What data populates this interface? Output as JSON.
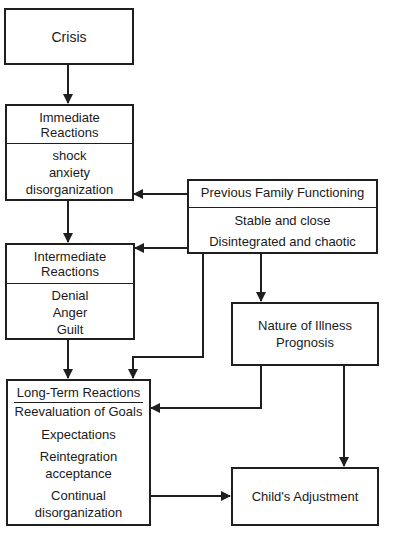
{
  "diagram": {
    "crisis": {
      "label": "Crisis"
    },
    "immediate": {
      "title": [
        "Immediate",
        "Reactions"
      ],
      "items": [
        "shock",
        "anxiety",
        "disorganization"
      ]
    },
    "intermediate": {
      "title": [
        "Intermediate",
        "Reactions"
      ],
      "items": [
        "Denial",
        "Anger",
        "Guilt"
      ]
    },
    "long_term": {
      "title": "Long-Term Reactions",
      "subtitle": "Reevaluation of Goals",
      "items": [
        "Expectations",
        "Reintegration",
        "acceptance",
        "Continual",
        "disorganization"
      ]
    },
    "previous_family": {
      "title": "Previous Family Functioning",
      "items": [
        "Stable and close",
        "Disintegrated and chaotic"
      ]
    },
    "nature_of_illness": {
      "lines": [
        "Nature of Illness",
        "Prognosis"
      ]
    },
    "childs_adjustment": {
      "label": "Child's Adjustment"
    }
  }
}
